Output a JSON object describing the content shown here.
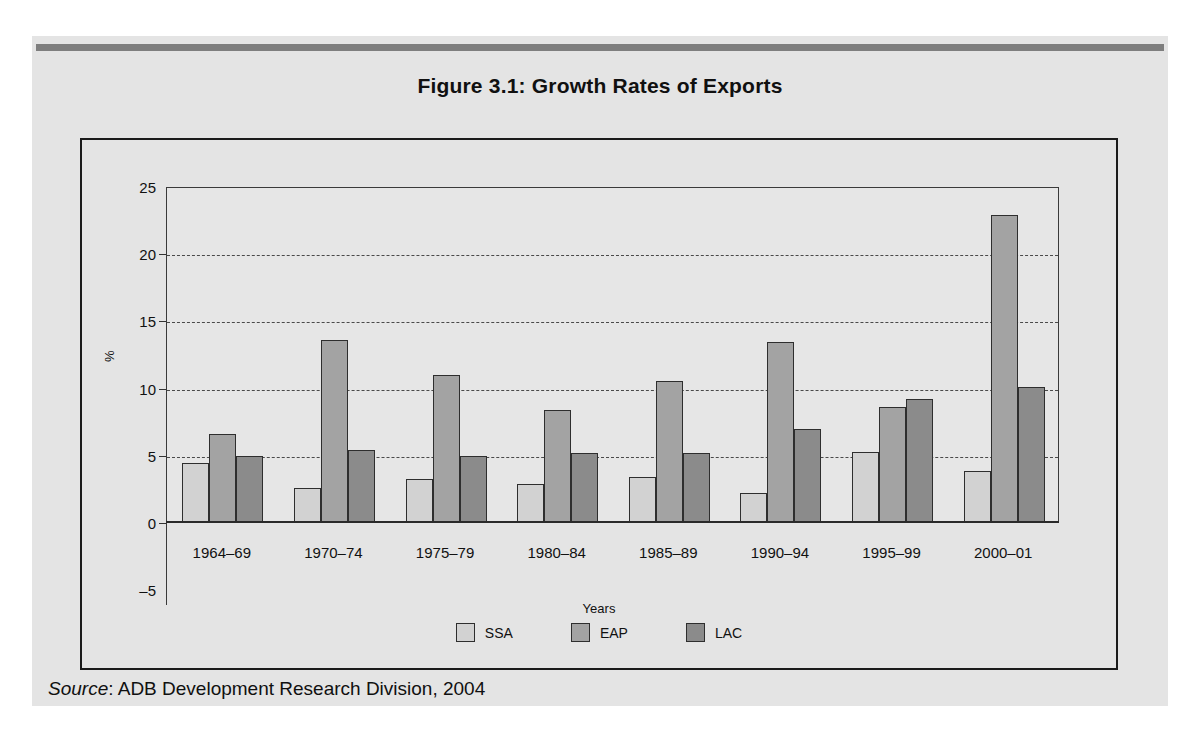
{
  "figure": {
    "title": "Figure 3.1:  Growth Rates of Exports",
    "source_word": "Source",
    "source_rest": ": ADB Development Research Division, 2004"
  },
  "colors": {
    "panel_background": "#e4e4e4",
    "plot_background": "#e6e6e6",
    "top_rule": "#7e7e7e",
    "frame": "#1a1a1a",
    "gridline": "#4a4a4a",
    "ssa": "#d2d2d2",
    "eap": "#a3a3a3",
    "lac": "#8b8b8b",
    "bar_outline": "#2e2e2e"
  },
  "chart_data": {
    "type": "bar",
    "title": "Figure 3.1:  Growth Rates of Exports",
    "xlabel": "Years",
    "ylabel": "%",
    "ylim": [
      -5,
      25
    ],
    "yticks": [
      25,
      20,
      15,
      10,
      5,
      0,
      -5
    ],
    "gridlines": [
      20,
      15,
      10,
      5
    ],
    "grid": true,
    "legend_position": "bottom",
    "legend_title": "Years",
    "categories": [
      "1964–69",
      "1970–74",
      "1975–79",
      "1980–84",
      "1985–89",
      "1990–94",
      "1995–99",
      "2000–01"
    ],
    "series": [
      {
        "name": "SSA",
        "color": "#d2d2d2",
        "values": [
          4.5,
          2.6,
          3.3,
          2.9,
          3.4,
          2.2,
          5.3,
          3.9
        ]
      },
      {
        "name": "EAP",
        "color": "#a3a3a3",
        "values": [
          6.6,
          13.6,
          11.0,
          8.4,
          10.6,
          13.5,
          8.6,
          22.9
        ]
      },
      {
        "name": "LAC",
        "color": "#8b8b8b",
        "values": [
          5.0,
          5.4,
          5.0,
          5.2,
          5.2,
          7.0,
          9.2,
          10.1
        ]
      }
    ]
  }
}
